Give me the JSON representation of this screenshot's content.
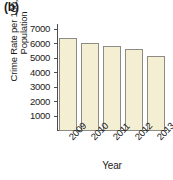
{
  "panel": {
    "label": "(b)"
  },
  "chart_data": {
    "type": "bar",
    "title": "",
    "subtitle": "",
    "xlabel": "Year",
    "ylabel": "Crime Rate per 100,000\nPopulation",
    "categories": [
      "2009",
      "2010",
      "2011",
      "2012",
      "2013"
    ],
    "values": [
      6400,
      6100,
      5850,
      5650,
      5200
    ],
    "series": [
      {
        "name": "Crime Rate per 100,000 Population",
        "values": [
          6400,
          6100,
          5850,
          5650,
          5200
        ]
      }
    ],
    "ylim": [
      0,
      7400
    ],
    "yticks": [
      1000,
      2000,
      3000,
      4000,
      5000,
      6000,
      7000
    ],
    "ytick_labels": [
      "1000",
      "2000",
      "3000",
      "4000",
      "5000",
      "6000",
      "7000"
    ],
    "xtick_labels": [
      "2009",
      "2010",
      "2011",
      "2012",
      "2013"
    ],
    "xtick_rotation": -45,
    "grid": false,
    "legend": false,
    "legend_position": "none",
    "bar_color": "#f4eed2",
    "bar_edge_color": "#8c8c84",
    "axis_color": "#4d4d4d",
    "background": "#ffffff"
  }
}
